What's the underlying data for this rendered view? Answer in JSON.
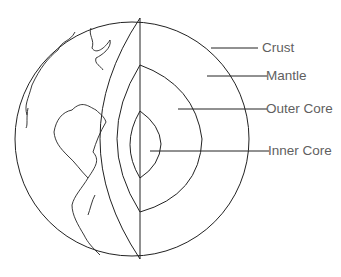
{
  "diagram": {
    "labels": [
      {
        "id": "crust",
        "text": "Crust"
      },
      {
        "id": "mantle",
        "text": "Mantle"
      },
      {
        "id": "outer_core",
        "text": "Outer Core"
      },
      {
        "id": "inner_core",
        "text": "Inner Core"
      }
    ],
    "colors": {
      "line": "#222222",
      "label": "#5f5f5f",
      "background": "#ffffff"
    }
  }
}
